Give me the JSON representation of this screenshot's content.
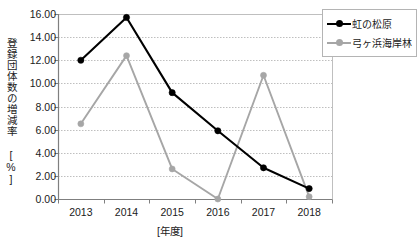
{
  "chart_data": {
    "type": "line",
    "title": "",
    "xlabel": "[年度]",
    "ylabel": "登録団体数の増減率 [%]",
    "categories": [
      "2013",
      "2014",
      "2015",
      "2016",
      "2017",
      "2018"
    ],
    "x": [
      2013,
      2014,
      2015,
      2016,
      2017,
      2018
    ],
    "series": [
      {
        "name": "虹の松原",
        "color": "#000000",
        "marker": "circle",
        "values": [
          12.0,
          15.7,
          9.2,
          5.9,
          2.7,
          0.9
        ]
      },
      {
        "name": "弓ヶ浜海岸林",
        "color": "#a6a6a6",
        "marker": "circle",
        "values": [
          6.5,
          12.4,
          2.6,
          0.0,
          10.7,
          0.2
        ]
      }
    ],
    "ylim": [
      0.0,
      16.0
    ],
    "ytick_step": 2.0,
    "ytick_labels": [
      "0.00",
      "2.00",
      "4.00",
      "6.00",
      "8.00",
      "10.00",
      "12.00",
      "14.00",
      "16.00"
    ],
    "grid": true,
    "grid_axis": "y",
    "legend_position": "top-right"
  },
  "legend": {
    "items": [
      {
        "label": "虹の松原"
      },
      {
        "label": "弓ヶ浜海岸林"
      }
    ]
  },
  "colors": {
    "series_1": "#000000",
    "series_2": "#a6a6a6",
    "grid": "#bfbfbf",
    "axis": "#7f7f7f",
    "plot_border": "#bfbfbf",
    "text": "#1a1a1a",
    "background": "#ffffff"
  }
}
